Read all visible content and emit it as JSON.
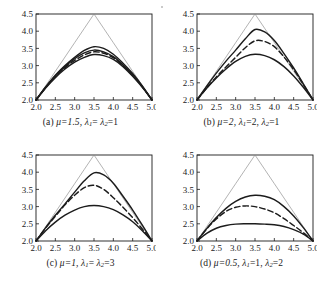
{
  "figure": {
    "background_color": "#ffffff",
    "ink_color": "#1c1c1c",
    "envelope_color": "#8a8a8a",
    "panel_count": 4,
    "artifact": "scan-speck"
  },
  "axes": {
    "x_ticks": [
      "2.0",
      "2.5",
      "3.0",
      "3.5",
      "4.0",
      "4.5",
      "5.0"
    ],
    "y_ticks": [
      "2.0",
      "2.5",
      "3.0",
      "3.5",
      "4.0",
      "4.5"
    ],
    "xlim": [
      2.0,
      5.0
    ],
    "ylim": [
      2.0,
      4.5
    ],
    "xlabel": "",
    "ylabel": ""
  },
  "panels": [
    {
      "id": "a",
      "caption_label": "(a)",
      "caption_mu": "μ=1.5,",
      "caption_lambda1": "λ",
      "caption_lambda1_sub": "1",
      "caption_mid": "= ",
      "caption_lambda2": "λ",
      "caption_lambda2_sub": "2",
      "caption_tail": "=1",
      "mu": 1.5,
      "lambda1": 1,
      "lambda2": 1
    },
    {
      "id": "b",
      "caption_label": "(b)",
      "caption_mu": "μ=2,",
      "caption_lambda1": "λ",
      "caption_lambda1_sub": "1",
      "caption_mid": "=2, ",
      "caption_lambda2": "λ",
      "caption_lambda2_sub": "2",
      "caption_tail": "=1",
      "mu": 2,
      "lambda1": 2,
      "lambda2": 1
    },
    {
      "id": "c",
      "caption_label": "(c)",
      "caption_mu": "μ=1,",
      "caption_lambda1": "λ",
      "caption_lambda1_sub": "1",
      "caption_mid": "= ",
      "caption_lambda2": "λ",
      "caption_lambda2_sub": "2",
      "caption_tail": "=3",
      "mu": 1,
      "lambda1": 3,
      "lambda2": 3
    },
    {
      "id": "d",
      "caption_label": "(d)",
      "caption_mu": "μ=0.5,",
      "caption_lambda1": "λ",
      "caption_lambda1_sub": "1",
      "caption_mid": "=1, ",
      "caption_lambda2": "λ",
      "caption_lambda2_sub": "2",
      "caption_tail": "=2",
      "mu": 0.5,
      "lambda1": 1,
      "lambda2": 2
    }
  ],
  "chart_data": [
    {
      "type": "line",
      "panel": "a",
      "title": "(a) μ=1.5, λ1= λ2=1",
      "xlabel": "",
      "ylabel": "",
      "xlim": [
        2.0,
        5.0
      ],
      "ylim": [
        2.0,
        4.5
      ],
      "xticks": [
        2.0,
        2.5,
        3.0,
        3.5,
        4.0,
        4.5,
        5.0
      ],
      "yticks": [
        2.0,
        2.5,
        3.0,
        3.5,
        4.0,
        4.5
      ],
      "grid": false,
      "legend": "none",
      "x": [
        2.0,
        2.25,
        2.5,
        2.75,
        3.0,
        3.25,
        3.5,
        3.75,
        4.0,
        4.25,
        4.5,
        4.75,
        5.0
      ],
      "series": [
        {
          "name": "envelope-triangle",
          "style": "thin-solid",
          "values": [
            2.0,
            2.4167,
            2.8333,
            3.25,
            3.6667,
            4.0833,
            4.5,
            4.0833,
            3.6667,
            3.25,
            2.8333,
            2.4167,
            2.0
          ]
        },
        {
          "name": "upper-solid",
          "style": "solid",
          "values": [
            2.0,
            2.38,
            2.72,
            3.0,
            3.24,
            3.44,
            3.55,
            3.5,
            3.33,
            3.07,
            2.77,
            2.41,
            2.0
          ]
        },
        {
          "name": "middle-solid",
          "style": "solid",
          "values": [
            2.0,
            2.37,
            2.7,
            2.97,
            3.2,
            3.37,
            3.45,
            3.4,
            3.26,
            3.02,
            2.73,
            2.39,
            2.0
          ]
        },
        {
          "name": "dashed",
          "style": "dashed",
          "values": [
            2.0,
            2.36,
            2.68,
            2.94,
            3.15,
            3.31,
            3.4,
            3.36,
            3.23,
            3.0,
            2.71,
            2.38,
            2.0
          ]
        },
        {
          "name": "lower-solid",
          "style": "solid",
          "values": [
            2.0,
            2.35,
            2.65,
            2.9,
            3.1,
            3.24,
            3.32,
            3.29,
            3.18,
            2.97,
            2.69,
            2.37,
            2.0
          ]
        }
      ]
    },
    {
      "type": "line",
      "panel": "b",
      "title": "(b) μ=2, λ1=2, λ2=1",
      "xlabel": "",
      "ylabel": "",
      "xlim": [
        2.0,
        5.0
      ],
      "ylim": [
        2.0,
        4.5
      ],
      "xticks": [
        2.0,
        2.5,
        3.0,
        3.5,
        4.0,
        4.5,
        5.0
      ],
      "yticks": [
        2.0,
        2.5,
        3.0,
        3.5,
        4.0,
        4.5
      ],
      "grid": false,
      "legend": "none",
      "x": [
        2.0,
        2.25,
        2.5,
        2.75,
        3.0,
        3.25,
        3.5,
        3.75,
        4.0,
        4.25,
        4.5,
        4.75,
        5.0
      ],
      "series": [
        {
          "name": "envelope-triangle",
          "style": "thin-solid",
          "values": [
            2.0,
            2.4167,
            2.8333,
            3.25,
            3.6667,
            4.0833,
            4.5,
            4.0833,
            3.6667,
            3.25,
            2.8333,
            2.4167,
            2.0
          ]
        },
        {
          "name": "upper-solid",
          "style": "solid",
          "values": [
            2.0,
            2.4,
            2.78,
            3.13,
            3.45,
            3.78,
            4.05,
            3.98,
            3.73,
            3.35,
            2.93,
            2.47,
            2.0
          ]
        },
        {
          "name": "dashed",
          "style": "dashed",
          "values": [
            2.0,
            2.35,
            2.67,
            2.96,
            3.24,
            3.52,
            3.72,
            3.7,
            3.55,
            3.25,
            2.88,
            2.45,
            2.0
          ]
        },
        {
          "name": "lower-solid",
          "style": "solid",
          "values": [
            2.0,
            2.34,
            2.64,
            2.9,
            3.12,
            3.27,
            3.33,
            3.29,
            3.17,
            2.97,
            2.7,
            2.37,
            2.0
          ]
        }
      ]
    },
    {
      "type": "line",
      "panel": "c",
      "title": "(c) μ=1, λ1= λ2=3",
      "xlabel": "",
      "ylabel": "",
      "xlim": [
        2.0,
        5.0
      ],
      "ylim": [
        2.0,
        4.5
      ],
      "xticks": [
        2.0,
        2.5,
        3.0,
        3.5,
        4.0,
        4.5,
        5.0
      ],
      "yticks": [
        2.0,
        2.5,
        3.0,
        3.5,
        4.0,
        4.5
      ],
      "grid": false,
      "legend": "none",
      "x": [
        2.0,
        2.25,
        2.5,
        2.75,
        3.0,
        3.25,
        3.5,
        3.75,
        4.0,
        4.25,
        4.5,
        4.75,
        5.0
      ],
      "series": [
        {
          "name": "envelope-triangle",
          "style": "thin-solid",
          "values": [
            2.0,
            2.4167,
            2.8333,
            3.25,
            3.6667,
            4.0833,
            4.5,
            4.0833,
            3.6667,
            3.25,
            2.8333,
            2.4167,
            2.0
          ]
        },
        {
          "name": "upper-solid",
          "style": "solid",
          "values": [
            2.0,
            2.39,
            2.75,
            3.08,
            3.42,
            3.75,
            3.98,
            3.92,
            3.68,
            3.3,
            2.9,
            2.46,
            2.0
          ]
        },
        {
          "name": "dashed",
          "style": "dashed",
          "values": [
            2.0,
            2.38,
            2.72,
            3.05,
            3.33,
            3.55,
            3.62,
            3.5,
            3.26,
            2.98,
            2.68,
            2.35,
            2.0
          ]
        },
        {
          "name": "lower-solid",
          "style": "solid",
          "values": [
            2.0,
            2.3,
            2.55,
            2.75,
            2.9,
            3.0,
            3.03,
            3.0,
            2.91,
            2.76,
            2.56,
            2.3,
            2.0
          ]
        }
      ]
    },
    {
      "type": "line",
      "panel": "d",
      "title": "(d) μ=0.5, λ1=1, λ2=2",
      "xlabel": "",
      "ylabel": "",
      "xlim": [
        2.0,
        5.0
      ],
      "ylim": [
        2.0,
        4.5
      ],
      "xticks": [
        2.0,
        2.5,
        3.0,
        3.5,
        4.0,
        4.5,
        5.0
      ],
      "yticks": [
        2.0,
        2.5,
        3.0,
        3.5,
        4.0,
        4.5
      ],
      "grid": false,
      "legend": "none",
      "x": [
        2.0,
        2.25,
        2.5,
        2.75,
        3.0,
        3.25,
        3.5,
        3.75,
        4.0,
        4.25,
        4.5,
        4.75,
        5.0
      ],
      "series": [
        {
          "name": "envelope-triangle",
          "style": "thin-solid",
          "values": [
            2.0,
            2.4167,
            2.8333,
            3.25,
            3.6667,
            4.0833,
            4.5,
            4.0833,
            3.6667,
            3.25,
            2.8333,
            2.4167,
            2.0
          ]
        },
        {
          "name": "upper-solid",
          "style": "solid",
          "values": [
            2.0,
            2.36,
            2.68,
            2.95,
            3.15,
            3.28,
            3.33,
            3.3,
            3.2,
            3.0,
            2.73,
            2.39,
            2.0
          ]
        },
        {
          "name": "dashed",
          "style": "dashed",
          "values": [
            2.0,
            2.35,
            2.64,
            2.86,
            2.98,
            3.02,
            3.0,
            2.93,
            2.82,
            2.65,
            2.45,
            2.24,
            2.0
          ]
        },
        {
          "name": "lower-solid",
          "style": "solid",
          "values": [
            2.0,
            2.22,
            2.37,
            2.45,
            2.49,
            2.5,
            2.5,
            2.49,
            2.47,
            2.42,
            2.33,
            2.2,
            2.0
          ]
        }
      ]
    }
  ]
}
